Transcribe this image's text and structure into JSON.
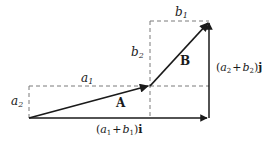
{
  "diagram": {
    "type": "vector-addition",
    "vectors": [
      {
        "name": "A",
        "label": "A"
      },
      {
        "name": "B",
        "label": "B"
      }
    ],
    "labels": {
      "a1": {
        "var": "a",
        "sub": "1"
      },
      "a2": {
        "var": "a",
        "sub": "2"
      },
      "b1": {
        "var": "b",
        "sub": "1"
      },
      "b2": {
        "var": "b",
        "sub": "2"
      },
      "sum_x": "(a₁ + b₁)i",
      "sum_y": "(a₂ + b₂)j"
    },
    "colors": {
      "stroke": "#1a1a1a",
      "dashed": "#7a7a7a"
    }
  },
  "text": {
    "A": "A",
    "B": "B",
    "a": "a",
    "b": "b",
    "sub1": "1",
    "sub2": "2",
    "open": "(",
    "plus": "+",
    "close": ")",
    "i": "i",
    "j": "j"
  }
}
